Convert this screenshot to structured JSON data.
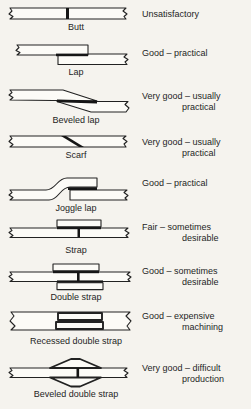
{
  "figure": {
    "colors": {
      "paper": "#f5f3ee",
      "plate": "#fcfbf7",
      "ink": "#161616"
    },
    "rows": [
      {
        "label": "Butt",
        "rating_line1": "Unsatisfactory",
        "rating_line2": ""
      },
      {
        "label": "Lap",
        "rating_line1": "Good – practical",
        "rating_line2": ""
      },
      {
        "label": "Beveled lap",
        "rating_line1": "Very good – usually",
        "rating_line2": "practical"
      },
      {
        "label": "Scarf",
        "rating_line1": "Very good – usually",
        "rating_line2": "practical"
      },
      {
        "label": "Joggle lap",
        "rating_line1": "Good – practical",
        "rating_line2": ""
      },
      {
        "label": "Strap",
        "rating_line1": "Fair – sometimes",
        "rating_line2": "desirable"
      },
      {
        "label": "Double strap",
        "rating_line1": "Good – sometimes",
        "rating_line2": "desirable"
      },
      {
        "label": "Recessed double strap",
        "rating_line1": "Good – expensive",
        "rating_line2": "machining"
      },
      {
        "label": "Beveled double strap",
        "rating_line1": "Very good – difficult",
        "rating_line2": "production"
      }
    ]
  }
}
